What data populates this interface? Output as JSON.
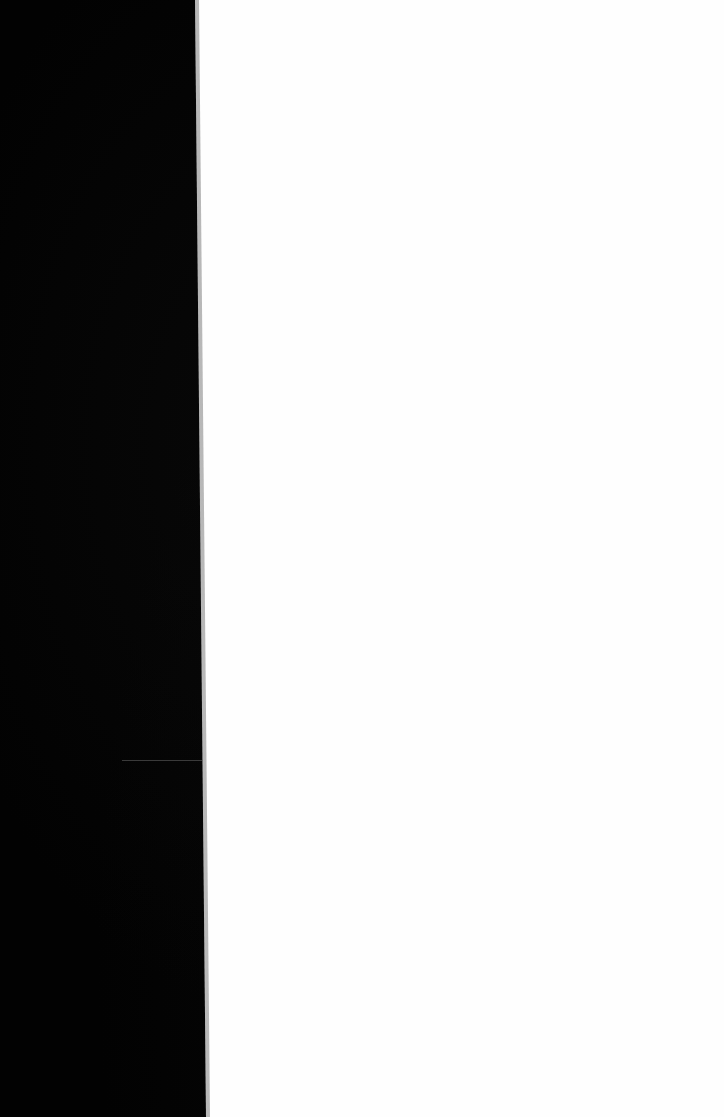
{
  "scene": {
    "description": "",
    "colors": {
      "dark_panel": "#020202",
      "light_area": "#fefefe",
      "line": "#3a3a3a"
    }
  }
}
